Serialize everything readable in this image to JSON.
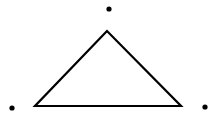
{
  "canvas": {
    "width": 217,
    "height": 117,
    "background": "#ffffff"
  },
  "triangle": {
    "stroke": "#000000",
    "stroke_width": 2.2,
    "fill": "none",
    "vertices": [
      {
        "name": "apex",
        "x": 107,
        "y": 31
      },
      {
        "name": "bottom-left",
        "x": 35,
        "y": 106
      },
      {
        "name": "bottom-right",
        "x": 181,
        "y": 106
      }
    ]
  },
  "points": [
    {
      "name": "top-point",
      "x": 109,
      "y": 9,
      "r": 2.6,
      "color": "#000000"
    },
    {
      "name": "left-point",
      "x": 12,
      "y": 108,
      "r": 2.6,
      "color": "#000000"
    },
    {
      "name": "right-point",
      "x": 205,
      "y": 107,
      "r": 2.6,
      "color": "#000000"
    }
  ]
}
